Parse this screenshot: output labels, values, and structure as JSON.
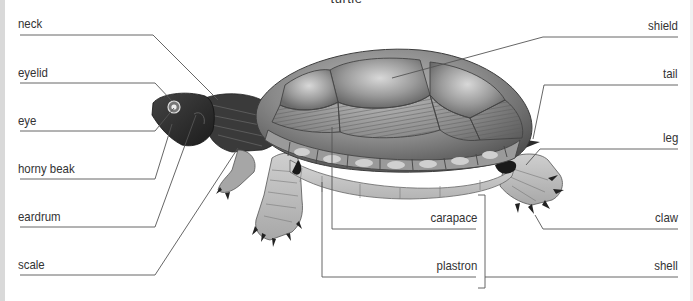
{
  "title": "turtle",
  "colors": {
    "background": "#ffffff",
    "label_text": "#333333",
    "leader_line": "#555555",
    "shell_dark": "#5a5a5a",
    "shell_mid": "#8c8c8c",
    "shell_light": "#c4c4c4",
    "plastron": "#cfcfcf",
    "skin_dark": "#2a2a2a",
    "leg_light": "#bdbdbd"
  },
  "labels": {
    "left": [
      {
        "id": "neck",
        "text": "neck"
      },
      {
        "id": "eyelid",
        "text": "eyelid"
      },
      {
        "id": "eye",
        "text": "eye"
      },
      {
        "id": "horny_beak",
        "text": "horny beak"
      },
      {
        "id": "eardrum",
        "text": "eardrum"
      },
      {
        "id": "scale",
        "text": "scale"
      }
    ],
    "right": [
      {
        "id": "shield",
        "text": "shield"
      },
      {
        "id": "tail",
        "text": "tail"
      },
      {
        "id": "leg",
        "text": "leg"
      },
      {
        "id": "claw",
        "text": "claw"
      },
      {
        "id": "shell",
        "text": "shell"
      }
    ],
    "center": [
      {
        "id": "carapace",
        "text": "carapace"
      },
      {
        "id": "plastron",
        "text": "plastron"
      }
    ]
  }
}
